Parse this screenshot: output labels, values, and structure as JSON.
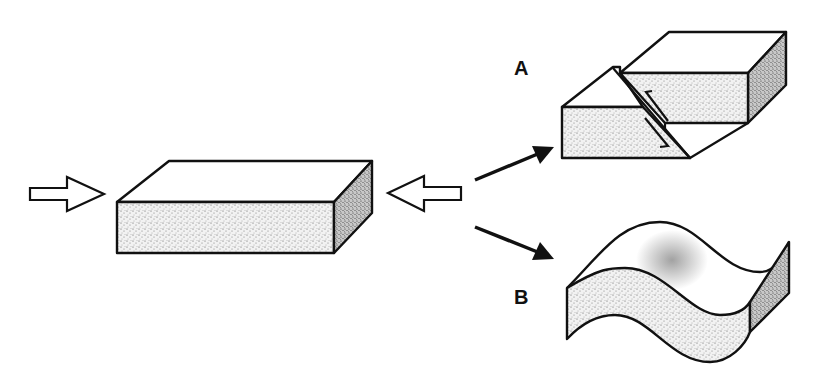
{
  "diagram": {
    "type": "geology-deformation",
    "colors": {
      "stroke": "#111111",
      "background": "#ffffff",
      "stipple_light": "#d8d8d8",
      "stipple_dark": "#8a8a8a"
    },
    "elements": {
      "original_block": "rectangular-rock-block",
      "stress_arrows": [
        "compression-arrow-left",
        "compression-arrow-right"
      ],
      "outcome_arrows": [
        "arrow-to-A",
        "arrow-to-B"
      ]
    },
    "labels": {
      "a": "A",
      "b": "B"
    },
    "outcomes": [
      {
        "label": "A",
        "name": "fault",
        "description": "block broken along an inclined fault plane with offset, half-arrows showing relative motion"
      },
      {
        "label": "B",
        "name": "fold",
        "description": "block bent into a wavy fold"
      }
    ]
  }
}
